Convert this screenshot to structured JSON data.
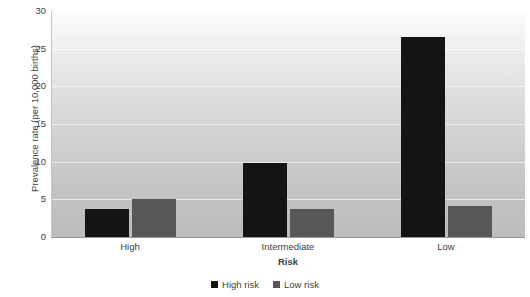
{
  "chart_data": {
    "type": "bar",
    "title": "",
    "xlabel": "Risk",
    "ylabel": "Prevalence rate (per 10,000 births)",
    "categories": [
      "High",
      "Intermediate",
      "Low"
    ],
    "series": [
      {
        "name": "High risk",
        "color": "#141414",
        "values": [
          3.7,
          9.8,
          26.5
        ]
      },
      {
        "name": "Low risk",
        "color": "#575757",
        "values": [
          5.1,
          3.7,
          4.1
        ]
      }
    ],
    "ylim": [
      0,
      30
    ],
    "ytick_step": 5,
    "ytick_labels": [
      "0",
      "5",
      "10",
      "15",
      "20",
      "25",
      "30"
    ],
    "grid": true,
    "grid_axis": "y",
    "legend_position": "bottom",
    "plot_background": "gradient-white-to-gray"
  },
  "legend": {
    "entries": [
      {
        "label": "High risk",
        "color": "#141414"
      },
      {
        "label": "Low risk",
        "color": "#575757"
      }
    ]
  },
  "axes": {
    "x_title": "Risk",
    "y_title": "Prevalence rate (per 10,000 births)"
  }
}
